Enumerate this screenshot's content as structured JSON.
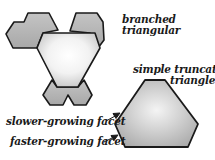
{
  "labels": {
    "branched_line1": "branched",
    "branched_line2": "triangular",
    "simple_line1": "simple truncated",
    "simple_line2": "triangle",
    "slower": "slower-growing facet",
    "faster": "faster-growing facet"
  },
  "colors": {
    "outline": "#1a1a1a",
    "gray_fill": "#b8b8b8",
    "center_fill": "#ffffff"
  }
}
